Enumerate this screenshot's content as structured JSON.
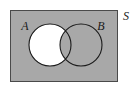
{
  "figure": {
    "kind": "venn-diagram",
    "width": 138,
    "height": 89
  },
  "colors": {
    "page_background": "#ffffff",
    "universe_fill": "#a8a8a8",
    "universe_stroke": "#4a4a4a",
    "circle_stroke": "#1a1a1a",
    "highlight_fill": "#ffffff",
    "label_color": "#1a1a1a"
  },
  "universe": {
    "label": "S",
    "label_x": 126,
    "label_y": 20,
    "rect": {
      "x": 10,
      "y": 10,
      "width": 108,
      "height": 72
    }
  },
  "sets": [
    {
      "name": "A",
      "label": "A",
      "label_x": 25,
      "label_y": 30,
      "cx": 50,
      "cy": 45,
      "r": 21,
      "filled": true
    },
    {
      "name": "B",
      "label": "B",
      "label_x": 101,
      "label_y": 30,
      "cx": 81,
      "cy": 45,
      "r": 21,
      "filled": false
    }
  ],
  "shaded_region": {
    "expression": "A minus B",
    "fill": "#ffffff"
  }
}
